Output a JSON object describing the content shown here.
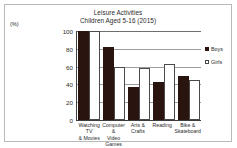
{
  "chart_data": {
    "type": "bar",
    "title": "Leisure Activities",
    "subtitle": "Children Aged 5-16  (2015)",
    "xlabel": "",
    "ylabel": "(%)",
    "ylim": [
      0,
      100
    ],
    "yticks": [
      100,
      80,
      60,
      40,
      20,
      0
    ],
    "grid": true,
    "legend_position": "right",
    "categories": [
      "Watching TV & Movies",
      "Computer & Video Games",
      "Arts & Crafts",
      "Reading",
      "Bike & Skateboard"
    ],
    "category_lines": [
      [
        "Watching TV",
        "& Movies"
      ],
      [
        "Computer &",
        "Video Games"
      ],
      [
        "Arts & Crafts",
        ""
      ],
      [
        "Reading",
        ""
      ],
      [
        "Bike &",
        "Skateboard"
      ]
    ],
    "series": [
      {
        "name": "Boys",
        "color": "#2a1410",
        "values": [
          100,
          82,
          37,
          43,
          50
        ]
      },
      {
        "name": "Girls",
        "color": "#ffffff",
        "values": [
          100,
          60,
          58,
          63,
          45
        ]
      }
    ]
  }
}
